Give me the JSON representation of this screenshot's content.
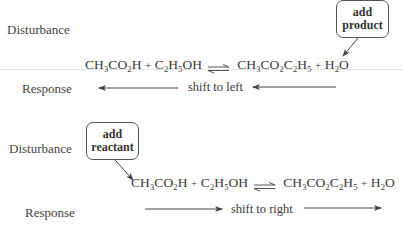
{
  "panels": [
    {
      "disturbance_label": "Disturbance",
      "response_label": "Response",
      "callout": {
        "line1": "add",
        "line2": "product"
      },
      "equation": {
        "reactant1": {
          "parts": [
            "CH",
            "3",
            "CO",
            "2",
            "H"
          ]
        },
        "plus1": "+",
        "reactant2": {
          "parts": [
            "C",
            "2",
            "H",
            "5",
            "OH"
          ]
        },
        "arrow": "⇌",
        "product1": {
          "parts": [
            "CH",
            "3",
            "CO",
            "2",
            "C",
            "2",
            "H",
            "5"
          ]
        },
        "plus2": "+",
        "product2": {
          "parts": [
            "H",
            "2",
            "O"
          ]
        }
      },
      "response_text": "shift to left",
      "direction": "left"
    },
    {
      "disturbance_label": "Disturbance",
      "response_label": "Response",
      "callout": {
        "line1": "add",
        "line2": "reactant"
      },
      "equation": {
        "reactant1": {
          "parts": [
            "CH",
            "3",
            "CO",
            "2",
            "H"
          ]
        },
        "plus1": "+",
        "reactant2": {
          "parts": [
            "C",
            "2",
            "H",
            "5",
            "OH"
          ]
        },
        "arrow": "⇌",
        "product1": {
          "parts": [
            "CH",
            "3",
            "CO",
            "2",
            "C",
            "2",
            "H",
            "5"
          ]
        },
        "plus2": "+",
        "product2": {
          "parts": [
            "H",
            "2",
            "O"
          ]
        }
      },
      "response_text": "shift to right",
      "direction": "right"
    }
  ]
}
